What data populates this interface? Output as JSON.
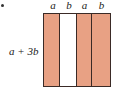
{
  "figure": {
    "bullet": "•",
    "side_label": "a + 3b",
    "top_labels": [
      "a",
      "b",
      "a",
      "b"
    ],
    "strips": [
      {
        "label": "a",
        "width": 16,
        "fill": "#e8a184"
      },
      {
        "label": "b",
        "width": 18,
        "fill": "#ffffff"
      },
      {
        "label": "a",
        "width": 15,
        "fill": "#e8a184"
      },
      {
        "label": "b",
        "width": 19,
        "fill": "#e8a184"
      }
    ],
    "border_color": "#3a2a26"
  }
}
